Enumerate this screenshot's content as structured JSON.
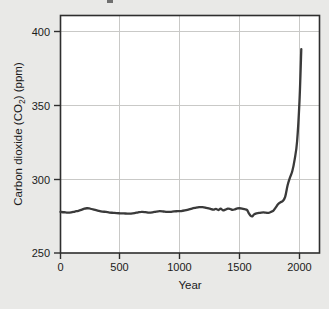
{
  "figure": {
    "background_color": "#e9e9e7",
    "plot_background_color": "#ffffff",
    "frame_color": "#2e2e2e",
    "gridline_color": "#c9c9c7",
    "line_color": "#3a3a3a"
  },
  "chart_data": {
    "type": "line",
    "title": "",
    "xlabel": "Year",
    "ylabel": "Carbon dioxide (CO2) (ppm)",
    "ylabel_display": "Carbon dioxide (CO₂) (ppm)",
    "xlim": [
      -140,
      2160
    ],
    "ylim": [
      250,
      407
    ],
    "xticks": [
      0,
      500,
      1000,
      1500,
      2000
    ],
    "xtick_labels": [
      "0",
      "500",
      "1000",
      "1500",
      "2000"
    ],
    "yticks": [
      250,
      300,
      350,
      400
    ],
    "ytick_labels": [
      "250",
      "300",
      "350",
      "400"
    ],
    "grid": "horizontal-and-vertical",
    "legend": "none",
    "series": [
      {
        "name": "Atmospheric CO2 concentration",
        "x": [
          0,
          30,
          60,
          90,
          120,
          150,
          180,
          200,
          220,
          240,
          260,
          290,
          320,
          350,
          380,
          410,
          440,
          470,
          500,
          530,
          560,
          590,
          620,
          650,
          680,
          710,
          740,
          770,
          800,
          830,
          860,
          890,
          920,
          950,
          980,
          1010,
          1040,
          1070,
          1100,
          1130,
          1160,
          1190,
          1220,
          1250,
          1280,
          1300,
          1320,
          1340,
          1360,
          1380,
          1400,
          1420,
          1440,
          1460,
          1480,
          1500,
          1520,
          1540,
          1560,
          1575,
          1590,
          1605,
          1620,
          1640,
          1660,
          1680,
          1700,
          1720,
          1740,
          1760,
          1780,
          1800,
          1820,
          1840,
          1860,
          1880,
          1900,
          1920,
          1940,
          1960,
          1980,
          2000,
          2015
        ],
        "y": [
          277.8,
          277.6,
          277.3,
          277.5,
          278.1,
          278.6,
          279.4,
          280.0,
          280.3,
          280.2,
          279.8,
          279.2,
          278.6,
          278.1,
          277.8,
          277.4,
          277.2,
          277.0,
          276.9,
          276.8,
          276.7,
          276.7,
          277.0,
          277.5,
          277.9,
          277.7,
          277.3,
          277.5,
          278.0,
          278.3,
          278.1,
          277.8,
          277.9,
          278.2,
          278.3,
          278.4,
          278.8,
          279.4,
          280.1,
          280.6,
          281.0,
          281.1,
          280.6,
          280.0,
          279.4,
          279.9,
          279.1,
          280.0,
          278.9,
          279.4,
          280.1,
          279.8,
          279.2,
          279.6,
          280.2,
          280.3,
          280.1,
          279.7,
          279.2,
          277.0,
          275.3,
          274.8,
          276.2,
          276.9,
          277.1,
          277.4,
          277.5,
          277.3,
          277.2,
          277.8,
          278.6,
          280.7,
          283.0,
          284.3,
          285.2,
          288.0,
          295.7,
          301.0,
          305.5,
          313.6,
          325.7,
          353.0,
          388.0
        ],
        "units": "ppm"
      }
    ],
    "notes": {
      "start_value_ppm": 277.8,
      "preindustrial_plateau_ppm": "~277–281",
      "minimum_ppm": 274.8,
      "minimum_year": 1605,
      "end_value_ppm": 388.0,
      "end_year": 2015
    }
  }
}
